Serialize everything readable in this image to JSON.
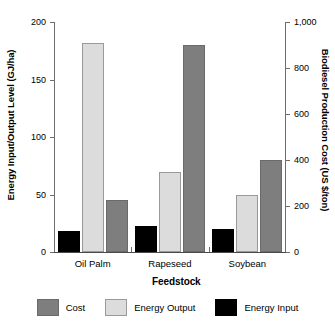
{
  "chart_data": {
    "type": "bar",
    "title": "",
    "xlabel": "Feedstock",
    "ylabel": "Energy Input/Output Level (GJ/ha)",
    "y2label": "Biodiesel Production Cost (US $/ton)",
    "categories": [
      "Oil Palm",
      "Rapeseed",
      "Soybean"
    ],
    "ylim": [
      0,
      200
    ],
    "y2lim": [
      0,
      1000
    ],
    "yticks": [
      "0",
      "50",
      "100",
      "150",
      "200"
    ],
    "ytick_values": [
      0,
      50,
      100,
      150,
      200
    ],
    "y2ticks": [
      "0",
      "200",
      "400",
      "600",
      "800",
      "1,000"
    ],
    "y2tick_values": [
      0,
      200,
      400,
      600,
      800,
      1000
    ],
    "grid": false,
    "legend_position": "bottom",
    "series": [
      {
        "name": "Energy Input",
        "axis": "left",
        "unit": "GJ/ha",
        "color": "#000000",
        "values": [
          18,
          23,
          20
        ]
      },
      {
        "name": "Energy Output",
        "axis": "left",
        "unit": "GJ/ha",
        "color": "#dcdcdc",
        "values": [
          182,
          70,
          50
        ]
      },
      {
        "name": "Cost",
        "axis": "right",
        "unit": "US $/ton",
        "color": "#7e7e7e",
        "values": [
          226,
          900,
          400
        ]
      }
    ],
    "legend": [
      {
        "label": "Cost",
        "color": "#7e7e7e"
      },
      {
        "label": "Energy Output",
        "color": "#dcdcdc"
      },
      {
        "label": "Energy Input",
        "color": "#000000"
      }
    ]
  }
}
